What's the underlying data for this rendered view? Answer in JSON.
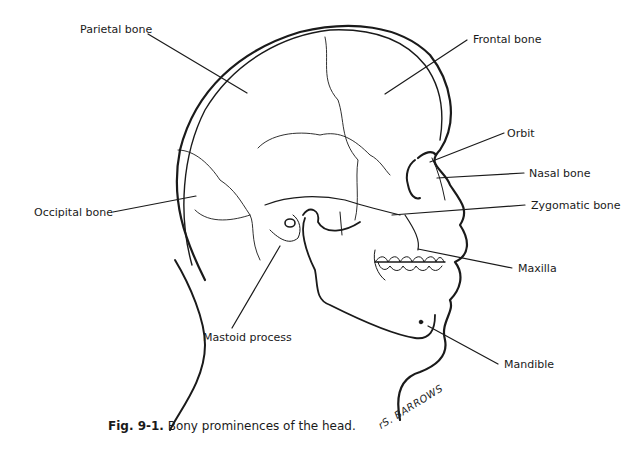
{
  "figure": {
    "title": "Bony prominences of the head",
    "caption_number": "Fig. 9-1.",
    "caption_text": " Bony prominences of the head.",
    "signature": "rS. BARROWS"
  },
  "labels": {
    "parietal": "Parietal bone",
    "frontal": "Frontal bone",
    "orbit": "Orbit",
    "nasal": "Nasal bone",
    "occipital": "Occipital bone",
    "zygomatic": "Zygomatic bone",
    "maxilla": "Maxilla",
    "mastoid": "Mastoid process",
    "mandible": "Mandible"
  },
  "colors": {
    "ink": "#1a1a1a",
    "background": "#ffffff"
  }
}
